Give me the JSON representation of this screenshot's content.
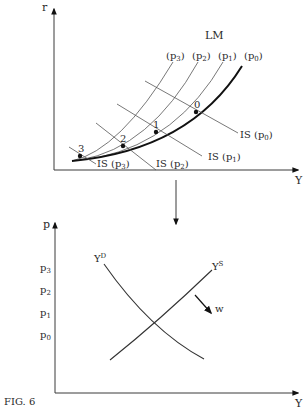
{
  "figure": {
    "caption": "FIG. 6"
  },
  "top_chart": {
    "y_axis_label": "r",
    "x_axis_label": "Y",
    "lm_label": "LM",
    "lm_curves": [
      {
        "label": "(p3)",
        "base": "(p",
        "sub": "3",
        "close": ")"
      },
      {
        "label": "(p2)",
        "base": "(p",
        "sub": "2",
        "close": ")"
      },
      {
        "label": "(p1)",
        "base": "(p",
        "sub": "1",
        "close": ")"
      },
      {
        "label": "(p0)",
        "base": "(p",
        "sub": "0",
        "close": ")"
      }
    ],
    "is_curves": [
      {
        "label": "IS (p0)",
        "base": "IS (p",
        "sub": "0",
        "close": ")"
      },
      {
        "label": "IS (p1)",
        "base": "IS (p",
        "sub": "1",
        "close": ")"
      },
      {
        "label": "IS (p2)",
        "base": "IS (p",
        "sub": "2",
        "close": ")"
      },
      {
        "label": "IS (p3)",
        "base": "IS (p",
        "sub": "3",
        "close": ")"
      }
    ],
    "points": [
      "0",
      "1",
      "2",
      "3"
    ]
  },
  "bottom_chart": {
    "y_axis_label": "p",
    "x_axis_label": "Y",
    "price_ticks": [
      {
        "base": "p",
        "sub": "3"
      },
      {
        "base": "p",
        "sub": "2"
      },
      {
        "base": "p",
        "sub": "1"
      },
      {
        "base": "p",
        "sub": "0"
      }
    ],
    "demand_label": {
      "base": "Y",
      "sup": "D"
    },
    "supply_label": {
      "base": "Y",
      "sup": "S"
    },
    "shift_label": "w"
  }
}
